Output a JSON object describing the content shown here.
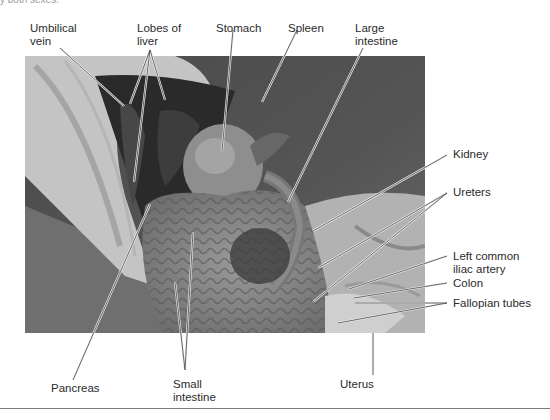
{
  "caption_remnant": "y both sexes.",
  "figure": {
    "labels": {
      "umbilical_vein": [
        "Umbilical",
        "vein"
      ],
      "lobes_of_liver": [
        "Lobes of",
        "liver"
      ],
      "stomach": [
        "Stomach"
      ],
      "spleen": [
        "Spleen"
      ],
      "large_intestine": [
        "Large",
        "intestine"
      ],
      "kidney": [
        "Kidney"
      ],
      "ureters": [
        "Ureters"
      ],
      "left_common_iliac_artery": [
        "Left common",
        "iliac artery"
      ],
      "colon": [
        "Colon"
      ],
      "fallopian_tubes": [
        "Fallopian tubes"
      ],
      "pancreas": [
        "Pancreas"
      ],
      "small_intestine": [
        "Small",
        "intestine"
      ],
      "uterus": [
        "Uterus"
      ]
    }
  },
  "colors": {
    "label_text": "#2b2b2b",
    "leader_line": "#f2f2f2",
    "photo_dark": "#3a3a3a",
    "photo_mid": "#7d7d7d",
    "photo_light": "#c8c8c8"
  }
}
